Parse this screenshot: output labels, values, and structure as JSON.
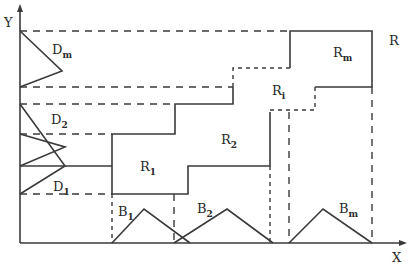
{
  "diagram": {
    "axes": {
      "x_label": "X",
      "y_label": "Y"
    },
    "region_label": "R",
    "input_sets": [
      {
        "name": "D",
        "sub": "1"
      },
      {
        "name": "D",
        "sub": "2"
      },
      {
        "name": "D",
        "sub": "m"
      }
    ],
    "output_sets": [
      {
        "name": "B",
        "sub": "1"
      },
      {
        "name": "B",
        "sub": "2"
      },
      {
        "name": "B",
        "sub": "m"
      }
    ],
    "regions": [
      {
        "name": "R",
        "sub": "1"
      },
      {
        "name": "R",
        "sub": "2"
      },
      {
        "name": "R",
        "sub": "i"
      },
      {
        "name": "R",
        "sub": "m"
      }
    ]
  }
}
